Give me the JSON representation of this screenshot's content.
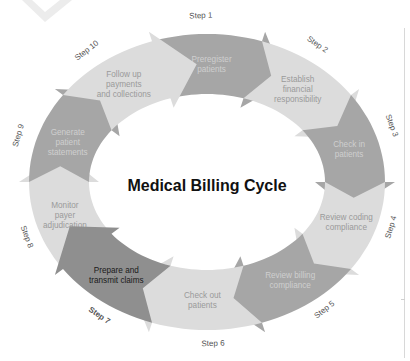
{
  "title": "Medical Billing Cycle",
  "colors": {
    "dark": "#a6a6a6",
    "light": "#dcdcdc",
    "highlight": "#8f8f8f",
    "text_on_dark": "#cfcfcf",
    "text_on_light": "#9a9a9a",
    "text_highlight": "#1a1a1a",
    "watermark": "#ececec"
  },
  "steps": [
    {
      "step": "Step 1",
      "lines": [
        "Preregister",
        "patients"
      ],
      "tone": "dark"
    },
    {
      "step": "Step 2",
      "lines": [
        "Establish",
        "financial",
        "responsibility"
      ],
      "tone": "light"
    },
    {
      "step": "Step 3",
      "lines": [
        "Check in",
        "patients"
      ],
      "tone": "dark"
    },
    {
      "step": "Step 4",
      "lines": [
        "Review coding",
        "compliance"
      ],
      "tone": "light"
    },
    {
      "step": "Step 5",
      "lines": [
        "Review billing",
        "compliance"
      ],
      "tone": "dark"
    },
    {
      "step": "Step 6",
      "lines": [
        "Check out",
        "patients"
      ],
      "tone": "light"
    },
    {
      "step": "Step 7",
      "lines": [
        "Prepare and",
        "transmit claims"
      ],
      "tone": "highlight"
    },
    {
      "step": "Step 8",
      "lines": [
        "Monitor",
        "payer",
        "adjudication"
      ],
      "tone": "light"
    },
    {
      "step": "Step 9",
      "lines": [
        "Generate",
        "patient",
        "statements"
      ],
      "tone": "dark"
    },
    {
      "step": "Step 10",
      "lines": [
        "Follow up",
        "payments",
        "and collections"
      ],
      "tone": "light"
    }
  ]
}
